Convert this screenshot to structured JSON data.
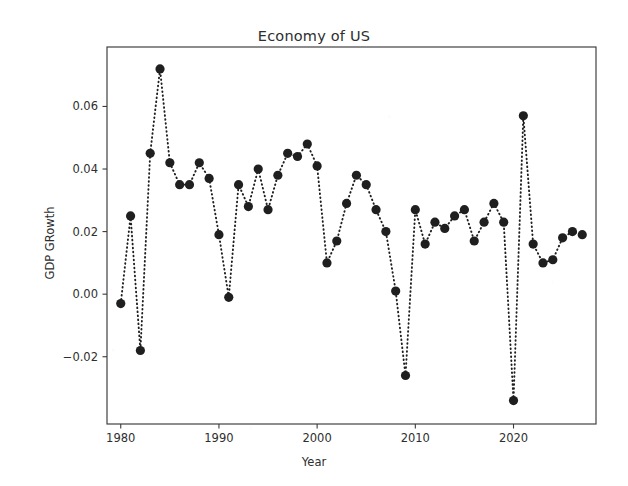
{
  "chart_data": {
    "type": "line",
    "title": "Economy of US",
    "xlabel": "Year",
    "ylabel": "GDP GRowth",
    "grid": false,
    "legend": null,
    "marker": "filled-circle",
    "linestyle": "dotted",
    "color": "#1f1f1f",
    "xlim": [
      1978.6,
      1028.4
    ],
    "ylim": [
      -0.0415,
      0.079
    ],
    "xticks": [
      1980,
      1990,
      2000,
      2010,
      2020
    ],
    "xticklabels": [
      "1980",
      "1990",
      "2000",
      "2010",
      "2020"
    ],
    "yticks": [
      -0.02,
      0.0,
      0.02,
      0.04,
      0.06
    ],
    "yticklabels": [
      "-0.02",
      "0.00",
      "0.02",
      "0.04",
      "0.06"
    ],
    "x": [
      1980,
      1981,
      1982,
      1983,
      1984,
      1985,
      1986,
      1987,
      1988,
      1989,
      1990,
      1991,
      1992,
      1993,
      1994,
      1995,
      1996,
      1997,
      1998,
      1999,
      2000,
      2001,
      2002,
      2003,
      2004,
      2005,
      2006,
      2007,
      2008,
      2009,
      2010,
      2011,
      2012,
      2013,
      2014,
      2015,
      2016,
      2017,
      2018,
      2019,
      2020,
      2021,
      2022,
      2023,
      2024,
      2025,
      2026,
      2027
    ],
    "values": [
      -0.003,
      0.025,
      -0.018,
      0.045,
      0.072,
      0.042,
      0.035,
      0.035,
      0.042,
      0.037,
      0.019,
      -0.001,
      0.035,
      0.028,
      0.04,
      0.027,
      0.038,
      0.045,
      0.044,
      0.048,
      0.041,
      0.01,
      0.017,
      0.029,
      0.038,
      0.035,
      0.027,
      0.02,
      0.001,
      -0.026,
      0.027,
      0.016,
      0.023,
      0.021,
      0.025,
      0.027,
      0.017,
      0.023,
      0.029,
      0.023,
      -0.034,
      0.057,
      0.016,
      0.01,
      0.011,
      0.018,
      0.02,
      0.019
    ],
    "series": [
      {
        "name": "GDP GRowth",
        "values": [
          -0.003,
          0.025,
          -0.018,
          0.045,
          0.072,
          0.042,
          0.035,
          0.035,
          0.042,
          0.037,
          0.019,
          -0.001,
          0.035,
          0.028,
          0.04,
          0.027,
          0.038,
          0.045,
          0.044,
          0.048,
          0.041,
          0.01,
          0.017,
          0.029,
          0.038,
          0.035,
          0.027,
          0.02,
          0.001,
          -0.026,
          0.027,
          0.016,
          0.023,
          0.021,
          0.025,
          0.027,
          0.017,
          0.023,
          0.029,
          0.023,
          -0.034,
          0.057,
          0.016,
          0.01,
          0.011,
          0.018,
          0.02,
          0.019
        ]
      }
    ]
  }
}
